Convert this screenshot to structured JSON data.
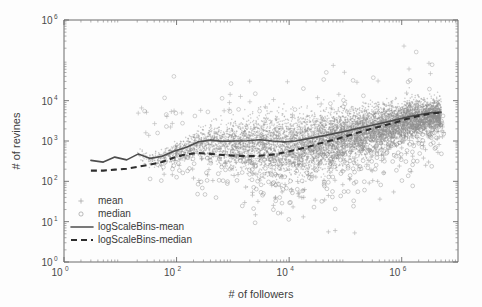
{
  "chart_data": {
    "type": "scatter",
    "title": "",
    "xlabel": "# of followers",
    "ylabel": "# of revines",
    "xscale": "log",
    "yscale": "log",
    "xlim": [
      1,
      10000000
    ],
    "ylim": [
      1,
      1000000
    ],
    "xticks": [
      "10^0",
      "10^2",
      "10^4",
      "10^6"
    ],
    "xtick_values": [
      1,
      100,
      10000,
      1000000
    ],
    "xtick_bases": [
      "10",
      "10",
      "10",
      "10"
    ],
    "xtick_exponents": [
      "0",
      "2",
      "4",
      "6"
    ],
    "yticks": [
      "10^0",
      "10^1",
      "10^2",
      "10^3",
      "10^4",
      "10^6"
    ],
    "ytick_values": [
      1,
      10,
      100,
      1000,
      10000,
      1000000
    ],
    "ytick_bases": [
      "10",
      "10",
      "10",
      "10",
      "10",
      "10"
    ],
    "ytick_exponents": [
      "0",
      "1",
      "2",
      "3",
      "4",
      "6"
    ],
    "grid": false,
    "legend_position": "lower left",
    "legend": [
      {
        "label": "mean",
        "marker": "plus",
        "style": "marker"
      },
      {
        "label": "median",
        "marker": "circle",
        "style": "marker"
      },
      {
        "label": "logScaleBins-mean",
        "marker": "line-solid",
        "style": "line"
      },
      {
        "label": "logScaleBins-median",
        "marker": "line-dashed",
        "style": "line"
      }
    ],
    "series": [
      {
        "name": "logScaleBins-mean",
        "style": "solid",
        "x": [
          3,
          5,
          8,
          13,
          21,
          34,
          55,
          90,
          150,
          240,
          400,
          650,
          1100,
          1800,
          3000,
          5000,
          8200,
          13000,
          22000,
          36000,
          60000,
          100000,
          165000,
          270000,
          450000,
          750000,
          1200000,
          2000000,
          3300000,
          5000000
        ],
        "y": [
          330,
          300,
          400,
          340,
          480,
          370,
          420,
          560,
          700,
          950,
          1050,
          980,
          1000,
          1020,
          1080,
          1000,
          950,
          1000,
          1150,
          1300,
          1500,
          1750,
          2050,
          2400,
          2800,
          3300,
          3900,
          4500,
          5000,
          5200
        ]
      },
      {
        "name": "logScaleBins-median",
        "style": "dashed",
        "x": [
          3,
          5,
          8,
          13,
          21,
          34,
          55,
          90,
          150,
          240,
          400,
          650,
          1100,
          1800,
          3000,
          5000,
          8200,
          13000,
          22000,
          36000,
          60000,
          100000,
          165000,
          270000,
          450000,
          750000,
          1200000,
          2000000,
          3300000,
          5000000
        ],
        "y": [
          185,
          185,
          195,
          205,
          230,
          260,
          300,
          390,
          470,
          500,
          480,
          450,
          430,
          420,
          430,
          460,
          520,
          600,
          720,
          880,
          1050,
          1300,
          1600,
          1950,
          2350,
          2850,
          3500,
          4200,
          4800,
          5100
        ]
      }
    ],
    "scatter_points": {
      "mean": {
        "marker": "plus",
        "color": "#8c8c8c",
        "count_note": "dense cloud"
      },
      "median": {
        "marker": "circle",
        "color": "#8c8c8c",
        "count_note": "dense cloud"
      }
    },
    "annotations": []
  }
}
